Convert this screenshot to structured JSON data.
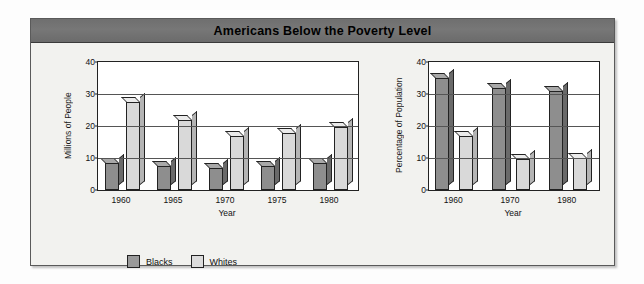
{
  "figure": {
    "title": "Americans Below the Poverty Level",
    "title_bar_color": "#707070",
    "panel_background": "#f2f2ef",
    "series_colors": {
      "blacks": "#8e8e8e",
      "whites": "#d9d9d9"
    }
  },
  "legend": {
    "items": [
      {
        "label": "Blacks",
        "swatch": "blacks-swatch"
      },
      {
        "label": "Whites",
        "swatch": "whites-swatch"
      }
    ]
  },
  "chart_data": [
    {
      "type": "bar",
      "title": "Americans Below the Poverty Level",
      "subtitle": "",
      "xlabel": "Year",
      "ylabel": "Millions of People",
      "categories": [
        "1960",
        "1965",
        "1970",
        "1975",
        "1980"
      ],
      "series": [
        {
          "name": "Blacks",
          "values": [
            8.5,
            7.5,
            7.0,
            7.5,
            8.5
          ]
        },
        {
          "name": "Whites",
          "values": [
            27.5,
            22.0,
            17.0,
            17.8,
            19.7
          ]
        }
      ],
      "yticks": [
        0,
        10,
        20,
        30,
        40
      ],
      "ylim": [
        0,
        40
      ],
      "grid": true,
      "legend_position": "bottom-left"
    },
    {
      "type": "bar",
      "title": "",
      "subtitle": "",
      "xlabel": "Year",
      "ylabel": "Percentage of Population",
      "categories": [
        "1960",
        "1970",
        "1980"
      ],
      "series": [
        {
          "name": "Blacks",
          "values": [
            35.0,
            32.0,
            31.0
          ]
        },
        {
          "name": "Whites",
          "values": [
            17.0,
            9.8,
            10.0
          ]
        }
      ],
      "yticks": [
        0,
        10,
        20,
        30,
        40
      ],
      "ylim": [
        0,
        40
      ],
      "grid": true,
      "legend_position": "bottom-left"
    }
  ]
}
